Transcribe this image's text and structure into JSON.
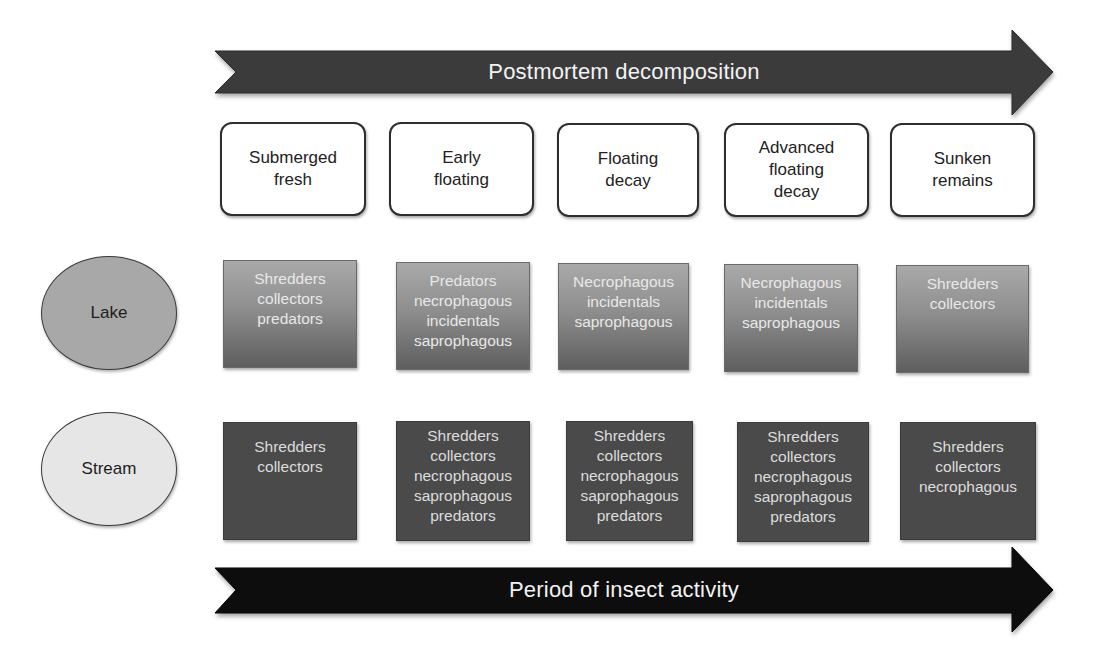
{
  "title": "Postmortem decomposition",
  "top_arrow": {
    "label": "Postmortem decomposition",
    "color": "#3a3a3a"
  },
  "bottom_arrow": {
    "label": "Period of insect activity",
    "color": "#0d0d0d"
  },
  "stages": [
    {
      "label": "Submerged\nfresh"
    },
    {
      "label": "Early\nfloating"
    },
    {
      "label": "Floating\ndecay"
    },
    {
      "label": "Advanced\nfloating\ndecay"
    },
    {
      "label": "Sunken\nremains"
    }
  ],
  "habitats": [
    {
      "name": "Lake",
      "fill": "#a8a8a8",
      "cells": [
        "Shredders\ncollectors\npredators",
        "Predators\nnecrophagous\nincidentals\nsaprophagous",
        "Necrophagous\nincidentals\nsaprophagous",
        "Necrophagous\nincidentals\nsaprophagous",
        "Shredders\ncollectors"
      ]
    },
    {
      "name": "Stream",
      "fill": "#e6e6e6",
      "cells": [
        "Shredders\ncollectors",
        "Shredders\ncollectors\nnecrophagous\nsaprophagous\npredators",
        "Shredders\ncollectors\nnecrophagous\nsaprophagous\npredators",
        "Shredders\ncollectors\nnecrophagous\nsaprophagous\npredators",
        "Shredders\ncollectors\nnecrophagous"
      ]
    }
  ]
}
